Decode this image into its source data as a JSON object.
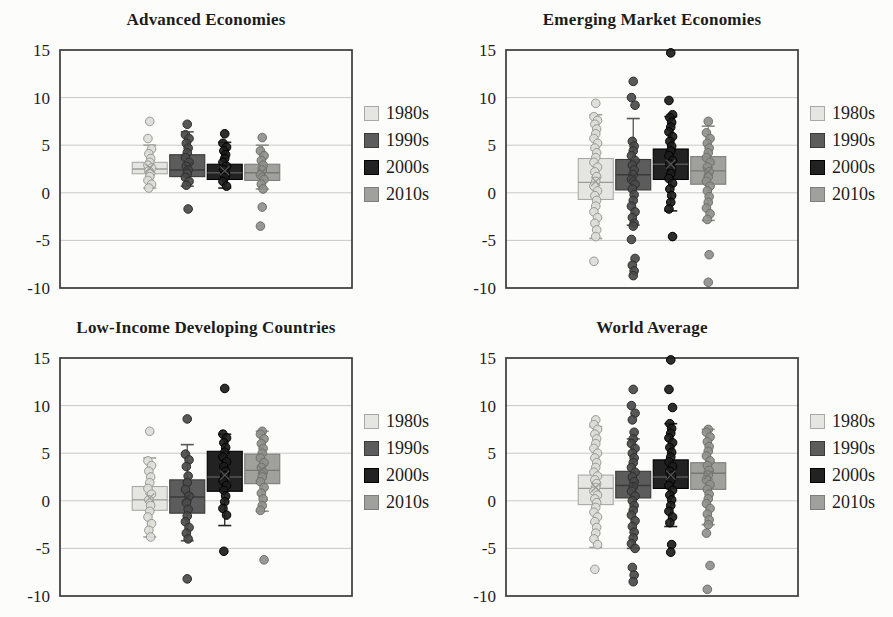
{
  "figure": {
    "background": "#fcfcfa",
    "frame_color": "#3a3a3a",
    "gridline_color": "#c9c9c4"
  },
  "decades": [
    {
      "label": "1980s",
      "fill": "#e5e5e2",
      "stroke": "#a9a9a5",
      "point_fill": "#dcdcd8",
      "point_stroke": "#989894",
      "median_color": "#9a9a96",
      "whisker_color": "#a0a09c"
    },
    {
      "label": "1990s",
      "fill": "#5c5c5c",
      "stroke": "#3a3a3a",
      "point_fill": "#4a4a4a",
      "point_stroke": "#2e2e2e",
      "median_color": "#3a3a3a",
      "whisker_color": "#555555"
    },
    {
      "label": "2000s",
      "fill": "#222222",
      "stroke": "#000000",
      "point_fill": "#1c1c1c",
      "point_stroke": "#000000",
      "median_color": "#555555",
      "whisker_color": "#222222"
    },
    {
      "label": "2010s",
      "fill": "#a0a09c",
      "stroke": "#7d7d79",
      "point_fill": "#8f8f8b",
      "point_stroke": "#6e6e6a",
      "median_color": "#777773",
      "whisker_color": "#8a8a86"
    }
  ],
  "chart_data": [
    {
      "type": "boxplot",
      "title": "Advanced Economies",
      "ylim": [
        -10,
        15
      ],
      "yticks": [
        15,
        10,
        5,
        0,
        -5,
        -10
      ],
      "grid": true,
      "legend_position": "right",
      "groups": [
        {
          "decade": "1980s",
          "q1": 2.0,
          "q3": 3.2,
          "median": 2.5,
          "mean": 2.6,
          "whisker_low": 0.5,
          "whisker_high": 5.0,
          "points": [
            7.5,
            5.7,
            4.6,
            4.1,
            3.6,
            3.2,
            2.9,
            2.6,
            2.3,
            2.0,
            1.7,
            1.3,
            0.9,
            0.5
          ]
        },
        {
          "decade": "1990s",
          "q1": 1.7,
          "q3": 4.0,
          "median": 2.4,
          "mean": 2.7,
          "whisker_low": 0.7,
          "whisker_high": 6.4,
          "points": [
            7.2,
            6.1,
            5.7,
            5.2,
            4.7,
            4.2,
            3.7,
            3.2,
            2.8,
            2.4,
            2.0,
            1.6,
            1.2,
            0.8,
            -1.7
          ]
        },
        {
          "decade": "2000s",
          "q1": 1.4,
          "q3": 3.0,
          "median": 2.1,
          "mean": 2.3,
          "whisker_low": 0.5,
          "whisker_high": 5.3,
          "points": [
            6.2,
            5.2,
            4.8,
            4.4,
            4.0,
            3.6,
            3.2,
            2.8,
            2.4,
            2.0,
            1.6,
            1.2,
            0.7
          ]
        },
        {
          "decade": "2010s",
          "q1": 1.3,
          "q3": 3.0,
          "median": 2.1,
          "mean": 2.2,
          "whisker_low": 0.4,
          "whisker_high": 5.0,
          "points": [
            5.8,
            4.4,
            3.9,
            3.4,
            2.9,
            2.4,
            1.9,
            1.4,
            0.9,
            0.4,
            -1.5,
            -3.5
          ]
        }
      ]
    },
    {
      "type": "boxplot",
      "title": "Emerging Market Economies",
      "ylim": [
        -10,
        15
      ],
      "yticks": [
        15,
        10,
        5,
        0,
        -5,
        -10
      ],
      "grid": true,
      "legend_position": "right",
      "groups": [
        {
          "decade": "1980s",
          "q1": -0.7,
          "q3": 3.6,
          "median": 1.1,
          "mean": 1.2,
          "whisker_low": -4.8,
          "whisker_high": 8.2,
          "points": [
            9.4,
            8.0,
            7.6,
            7.2,
            6.7,
            6.2,
            5.7,
            5.2,
            4.7,
            4.2,
            3.7,
            3.2,
            2.7,
            2.2,
            1.7,
            1.2,
            0.7,
            0.2,
            -0.3,
            -0.8,
            -1.4,
            -2.0,
            -2.6,
            -3.2,
            -3.9,
            -4.6,
            -7.2
          ]
        },
        {
          "decade": "1990s",
          "q1": 0.3,
          "q3": 3.5,
          "median": 1.9,
          "mean": 1.7,
          "whisker_low": -3.4,
          "whisker_high": 7.8,
          "points": [
            11.7,
            10.0,
            9.2,
            5.4,
            4.9,
            4.4,
            3.9,
            3.4,
            2.9,
            2.4,
            1.9,
            1.4,
            0.9,
            0.4,
            -0.2,
            -0.8,
            -1.4,
            -2.0,
            -2.6,
            -3.2,
            -3.5,
            -4.9,
            -6.9,
            -7.6,
            -8.2,
            -8.7
          ]
        },
        {
          "decade": "2000s",
          "q1": 1.4,
          "q3": 4.6,
          "median": 3.0,
          "mean": 3.0,
          "whisker_low": -1.9,
          "whisker_high": 8.0,
          "points": [
            14.7,
            9.7,
            8.2,
            7.9,
            7.4,
            6.9,
            6.4,
            5.9,
            5.4,
            4.9,
            4.4,
            3.9,
            3.4,
            3.0,
            2.5,
            2.0,
            1.5,
            1.0,
            0.4,
            -0.3,
            -1.0,
            -1.7,
            -4.6
          ]
        },
        {
          "decade": "2010s",
          "q1": 0.9,
          "q3": 3.8,
          "median": 2.3,
          "mean": 2.2,
          "whisker_low": -2.9,
          "whisker_high": 7.0,
          "points": [
            7.5,
            6.3,
            5.7,
            5.2,
            4.7,
            4.2,
            3.7,
            3.2,
            2.7,
            2.2,
            1.7,
            1.2,
            0.7,
            0.2,
            -0.4,
            -1.0,
            -1.6,
            -2.2,
            -2.8,
            -6.5,
            -9.4
          ]
        }
      ]
    },
    {
      "type": "boxplot",
      "title": "Low-Income Developing Countries",
      "ylim": [
        -10,
        15
      ],
      "yticks": [
        15,
        10,
        5,
        0,
        -5,
        -10
      ],
      "grid": true,
      "legend_position": "right",
      "groups": [
        {
          "decade": "1980s",
          "q1": -1.0,
          "q3": 1.5,
          "median": 0.1,
          "mean": 0.3,
          "whisker_low": -3.8,
          "whisker_high": 4.5,
          "points": [
            7.3,
            4.2,
            3.7,
            3.1,
            2.5,
            1.9,
            1.3,
            0.7,
            0.1,
            -0.5,
            -1.1,
            -1.7,
            -2.4,
            -3.1,
            -3.8
          ]
        },
        {
          "decade": "1990s",
          "q1": -1.3,
          "q3": 2.2,
          "median": 0.4,
          "mean": 0.4,
          "whisker_low": -4.2,
          "whisker_high": 5.9,
          "points": [
            8.6,
            4.9,
            4.3,
            3.6,
            2.6,
            1.9,
            1.2,
            0.5,
            -0.2,
            -0.9,
            -1.6,
            -2.2,
            -2.8,
            -3.4,
            -4.0,
            -8.2
          ]
        },
        {
          "decade": "2000s",
          "q1": 1.0,
          "q3": 5.2,
          "median": 2.5,
          "mean": 2.7,
          "whisker_low": -2.6,
          "whisker_high": 7.0,
          "points": [
            11.8,
            7.0,
            6.6,
            6.1,
            5.6,
            5.1,
            4.6,
            4.1,
            3.6,
            3.1,
            2.6,
            2.1,
            1.6,
            1.1,
            0.5,
            -0.1,
            -0.8,
            -1.5,
            -5.3
          ]
        },
        {
          "decade": "2010s",
          "q1": 1.8,
          "q3": 4.9,
          "median": 3.2,
          "mean": 3.3,
          "whisker_low": -1.1,
          "whisker_high": 7.3,
          "points": [
            7.3,
            7.0,
            6.5,
            6.0,
            5.5,
            5.0,
            4.5,
            4.0,
            3.5,
            3.0,
            2.5,
            2.0,
            1.4,
            0.8,
            0.2,
            -0.5,
            -1.0,
            -6.2
          ]
        }
      ]
    },
    {
      "type": "boxplot",
      "title": "World Average",
      "ylim": [
        -10,
        15
      ],
      "yticks": [
        15,
        10,
        5,
        0,
        -5,
        -10
      ],
      "grid": true,
      "legend_position": "right",
      "groups": [
        {
          "decade": "1980s",
          "q1": -0.4,
          "q3": 2.7,
          "median": 1.3,
          "mean": 1.4,
          "whisker_low": -4.9,
          "whisker_high": 7.8,
          "points": [
            8.5,
            8.0,
            7.5,
            7.0,
            6.5,
            6.0,
            5.5,
            5.0,
            4.5,
            4.0,
            3.5,
            3.0,
            2.6,
            2.2,
            1.8,
            1.4,
            1.0,
            0.6,
            0.2,
            -0.2,
            -0.7,
            -1.2,
            -1.7,
            -2.2,
            -2.8,
            -3.4,
            -4.0,
            -4.6,
            -7.2
          ]
        },
        {
          "decade": "1990s",
          "q1": 0.3,
          "q3": 3.1,
          "median": 1.6,
          "mean": 1.7,
          "whisker_low": -5.0,
          "whisker_high": 6.5,
          "points": [
            11.7,
            10.0,
            9.2,
            8.5,
            7.2,
            6.5,
            6.0,
            5.5,
            5.0,
            4.5,
            4.0,
            3.5,
            3.0,
            2.5,
            2.0,
            1.5,
            1.0,
            0.5,
            0.0,
            -0.5,
            -1.0,
            -1.5,
            -2.1,
            -2.7,
            -3.3,
            -3.9,
            -4.5,
            -5.0,
            -7.0,
            -7.8,
            -8.5
          ]
        },
        {
          "decade": "2000s",
          "q1": 1.3,
          "q3": 4.3,
          "median": 2.5,
          "mean": 2.7,
          "whisker_low": -2.7,
          "whisker_high": 8.1,
          "points": [
            14.8,
            11.7,
            9.8,
            8.1,
            7.6,
            7.1,
            6.6,
            6.1,
            5.6,
            5.1,
            4.6,
            4.1,
            3.6,
            3.1,
            2.6,
            2.1,
            1.6,
            1.1,
            0.6,
            0.1,
            -0.5,
            -1.1,
            -1.7,
            -2.3,
            -4.6,
            -5.4
          ]
        },
        {
          "decade": "2010s",
          "q1": 1.2,
          "q3": 4.0,
          "median": 2.9,
          "mean": 2.7,
          "whisker_low": -2.5,
          "whisker_high": 7.5,
          "points": [
            7.5,
            7.2,
            6.7,
            6.2,
            5.7,
            5.2,
            4.7,
            4.2,
            3.7,
            3.2,
            2.7,
            2.2,
            1.7,
            1.2,
            0.7,
            0.2,
            -0.3,
            -0.8,
            -1.4,
            -2.0,
            -2.5,
            -3.4,
            -6.8,
            -9.3
          ]
        }
      ]
    }
  ]
}
